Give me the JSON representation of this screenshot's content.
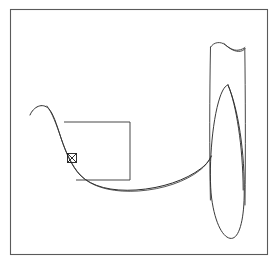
{
  "figure": {
    "title": "",
    "background_color": "#ffffff",
    "frame": {
      "label": "figure border",
      "stroke_color": "#5a5a5a",
      "x": 10,
      "y": 9,
      "width": 258,
      "height": 246
    },
    "caption": {
      "text": "",
      "visible": false
    }
  },
  "chart_data": {
    "type": "line",
    "title": "",
    "subtitle": "",
    "xlabel": "",
    "ylabel": "",
    "grid": false,
    "legend_position": "none",
    "xlim": [
      0,
      277
    ],
    "ylim": [
      268,
      0
    ],
    "annotations": [
      {
        "name": "point-marker",
        "shape": "square-with-cross",
        "x": 72,
        "y": 158,
        "size": 9
      }
    ],
    "series": [
      {
        "name": "descending-curve",
        "kind": "path",
        "stroke": "#2b2b2b",
        "points": [
          [
            30,
            115
          ],
          [
            36,
            108
          ],
          [
            45,
            106
          ],
          [
            52,
            112
          ],
          [
            58,
            125
          ],
          [
            66,
            145
          ],
          [
            74,
            161
          ],
          [
            86,
            175
          ],
          [
            104,
            185
          ],
          [
            130,
            190
          ],
          [
            160,
            187
          ],
          [
            186,
            178
          ],
          [
            204,
            165
          ],
          [
            213,
            155
          ]
        ]
      },
      {
        "name": "descending-curve-shadow",
        "kind": "path",
        "stroke": "#3a3a3a",
        "points": [
          [
            48,
            110
          ],
          [
            54,
            120
          ],
          [
            60,
            133
          ],
          [
            68,
            150
          ],
          [
            78,
            165
          ],
          [
            92,
            176
          ],
          [
            112,
            182
          ],
          [
            136,
            183
          ],
          [
            160,
            180
          ],
          [
            182,
            172
          ],
          [
            200,
            161
          ],
          [
            210,
            152
          ]
        ]
      },
      {
        "name": "square-region",
        "kind": "polyline",
        "stroke": "#3d3d3d",
        "points": [
          [
            64,
            122
          ],
          [
            130,
            122
          ],
          [
            130,
            180
          ],
          [
            76,
            180
          ]
        ]
      }
    ],
    "shapes": [
      {
        "name": "tube-body",
        "kind": "cylinder",
        "stroke": "#3d3d3d",
        "left_x": 210,
        "right_x": 245,
        "top_y": 45,
        "bottom_y": 238
      },
      {
        "name": "tube-top-saddle",
        "kind": "wave",
        "stroke": "#3d3d3d",
        "left_x": 210,
        "right_x": 245,
        "y": 47
      },
      {
        "name": "lens-cross-section",
        "kind": "lens",
        "stroke": "#2e2e2e",
        "center_x": 228,
        "top_y": 85,
        "bottom_y": 238,
        "half_width": 18
      }
    ]
  }
}
